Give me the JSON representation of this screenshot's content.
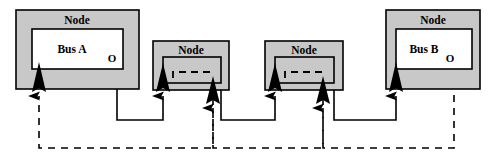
{
  "diagram": {
    "type": "block-diagram",
    "title": "",
    "background_color": "#ffffff",
    "node_fill_color": "#c8c8c8",
    "inner_fill_color": "#ffffff",
    "stroke_color": "#000000",
    "nodes": [
      {
        "id": "node-1",
        "label": "Node",
        "inner_label": "Bus A",
        "has_inner_box": true,
        "output_port_label": "O",
        "input_port_label": "I",
        "x": 16,
        "y": 10,
        "w": 123,
        "h": 79,
        "inner": {
          "x": 32,
          "y": 29,
          "w": 91,
          "h": 40
        }
      },
      {
        "id": "node-2",
        "label": "Node",
        "inner_label": "",
        "has_inner_box": true,
        "output_port_label": "",
        "input_port_label": "",
        "x": 153,
        "y": 41,
        "w": 76,
        "h": 49,
        "inner": {
          "x": 163,
          "y": 57,
          "w": 58,
          "h": 26
        }
      },
      {
        "id": "node-3",
        "label": "Node",
        "inner_label": "",
        "has_inner_box": true,
        "output_port_label": "",
        "input_port_label": "",
        "x": 265,
        "y": 41,
        "w": 78,
        "h": 49,
        "inner": {
          "x": 275,
          "y": 57,
          "w": 59,
          "h": 26
        }
      },
      {
        "id": "node-4",
        "label": "Node",
        "inner_label": "Bus B",
        "has_inner_box": true,
        "output_port_label": "O",
        "input_port_label": "",
        "x": 386,
        "y": 10,
        "w": 94,
        "h": 79,
        "inner": {
          "x": 396,
          "y": 29,
          "w": 76,
          "h": 40
        }
      }
    ],
    "solid_connections": [
      {
        "id": "conn-bus-a-out-to-node-2",
        "from": "node-1.O",
        "to": "node-2.in",
        "style": "solid"
      },
      {
        "id": "conn-node-2-out-to-node-3",
        "from": "node-2.out",
        "to": "node-3.in",
        "style": "solid"
      },
      {
        "id": "conn-node-3-out-to-node-4",
        "from": "node-3.out",
        "to": "node-4.in",
        "style": "solid"
      }
    ],
    "dashed_connections": [
      {
        "id": "dconn-node-2-to-node-1",
        "from": "node-2.dashed-out",
        "to": "node-1.in",
        "style": "dashed"
      },
      {
        "id": "dconn-node-3-to-node-2",
        "from": "node-3.dashed-out",
        "to": "node-2.dashed-in",
        "style": "dashed"
      },
      {
        "id": "dconn-bus-b-out-to-node-3",
        "from": "node-4.O",
        "to": "node-3.dashed-in",
        "style": "dashed"
      }
    ],
    "arrowheads": [
      {
        "id": "arrow-node-1-in",
        "x": 39,
        "y": 88
      },
      {
        "id": "arrow-node-2-in",
        "x": 163,
        "y": 88
      },
      {
        "id": "arrow-node-2-dashed-in",
        "x": 213,
        "y": 100
      },
      {
        "id": "arrow-node-3-in",
        "x": 275,
        "y": 88
      },
      {
        "id": "arrow-node-3-dashed-in",
        "x": 323,
        "y": 100
      },
      {
        "id": "arrow-node-4-in",
        "x": 396,
        "y": 88
      }
    ]
  }
}
